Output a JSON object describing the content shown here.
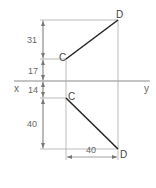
{
  "diagram": {
    "axis": {
      "left_label": "x",
      "right_label": "y"
    },
    "points": {
      "top_C": "C",
      "top_D": "D",
      "bottom_C": "C",
      "bottom_D": "D"
    },
    "dimensions": {
      "d_top_31": "31",
      "d_top_17": "17",
      "d_bottom_14": "14",
      "d_bottom_40": "40",
      "d_horizontal_40": "40"
    },
    "colors": {
      "line_main": "#222222",
      "line_thin": "#999999",
      "text": "#666666"
    }
  }
}
